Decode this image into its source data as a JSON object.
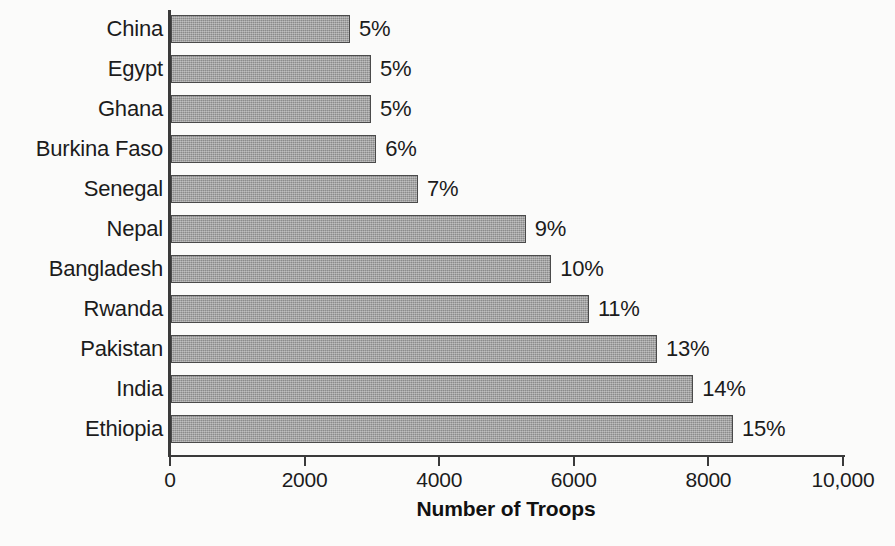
{
  "chart_data": {
    "type": "bar",
    "orientation": "horizontal",
    "title": "",
    "xlabel": "Number of Troops",
    "ylabel": "",
    "xlim": [
      0,
      10000
    ],
    "grid": false,
    "legend": null,
    "x_ticks": [
      {
        "value": 0,
        "label": "0"
      },
      {
        "value": 2000,
        "label": "2000"
      },
      {
        "value": 4000,
        "label": "4000"
      },
      {
        "value": 6000,
        "label": "6000"
      },
      {
        "value": 8000,
        "label": "8000"
      },
      {
        "value": 10000,
        "label": "10,000"
      }
    ],
    "categories": [
      "China",
      "Egypt",
      "Ghana",
      "Burkina Faso",
      "Senegal",
      "Nepal",
      "Bangladesh",
      "Rwanda",
      "Pakistan",
      "India",
      "Ethiopia"
    ],
    "values": [
      2660,
      2970,
      2970,
      3050,
      3670,
      5270,
      5650,
      6210,
      7220,
      7760,
      8350
    ],
    "data_labels": [
      "5%",
      "5%",
      "5%",
      "6%",
      "7%",
      "9%",
      "10%",
      "11%",
      "13%",
      "14%",
      "15%"
    ],
    "bars": [
      {
        "category": "China",
        "value": 2660,
        "data_label": "5%"
      },
      {
        "category": "Egypt",
        "value": 2970,
        "data_label": "5%"
      },
      {
        "category": "Ghana",
        "value": 2970,
        "data_label": "5%"
      },
      {
        "category": "Burkina Faso",
        "value": 3050,
        "data_label": "6%"
      },
      {
        "category": "Senegal",
        "value": 3670,
        "data_label": "7%"
      },
      {
        "category": "Nepal",
        "value": 5270,
        "data_label": "9%"
      },
      {
        "category": "Bangladesh",
        "value": 5650,
        "data_label": "10%"
      },
      {
        "category": "Rwanda",
        "value": 6210,
        "data_label": "11%"
      },
      {
        "category": "Pakistan",
        "value": 7220,
        "data_label": "13%"
      },
      {
        "category": "India",
        "value": 7760,
        "data_label": "14%"
      },
      {
        "category": "Ethiopia",
        "value": 8350,
        "data_label": "15%"
      }
    ],
    "colors": {
      "bar_fill": "#9b9b9b",
      "bar_border": "#4a4a4a",
      "axis": "#3a3a3a",
      "text": "#1c1c1c",
      "background": "#fbfbfa"
    }
  }
}
